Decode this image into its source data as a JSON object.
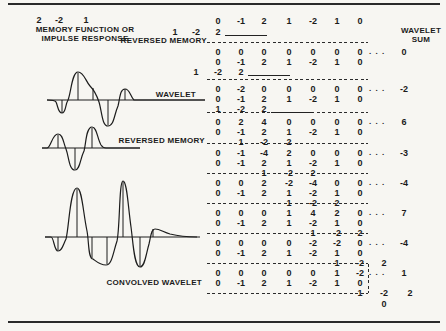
{
  "figure": {
    "memory_function": {
      "values": [
        "2",
        "-2",
        "1"
      ],
      "label_line1": "MEMORY FUNCTION OR",
      "label_line2": "IMPULSE RESPONSE"
    },
    "labels": {
      "reversed_memory_row": "REVERSED MEMORY",
      "wavelet_wave": "WAVELET",
      "reversed_memory_wave": "REVERSED MEMORY",
      "convolved_wave": "CONVOLVED WAVELET",
      "sum_header_line1": "WAVELET",
      "sum_header_line2": "SUM"
    },
    "table": {
      "wavelet": [
        "0",
        "-1",
        "2",
        "1",
        "-2",
        "1",
        "0"
      ],
      "reversed_memory": [
        "1",
        "-2",
        "2"
      ],
      "dots": ". . .",
      "header_memory_cols": [
        0,
        1,
        2
      ],
      "header_underline": true,
      "blocks": [
        {
          "products": [
            "0",
            "0",
            "0",
            "0",
            "0",
            "0",
            "0"
          ],
          "sum": "0",
          "memory_cols": [
            1,
            2,
            3
          ],
          "underline": true
        },
        {
          "products": [
            "0",
            "-2",
            "0",
            "0",
            "0",
            "0",
            "0"
          ],
          "sum": "-2",
          "memory_cols": [
            2,
            3,
            4
          ],
          "underline": true
        },
        {
          "products": [
            "0",
            "2",
            "4",
            "0",
            "0",
            "0",
            "0"
          ],
          "sum": "6",
          "memory_cols": [
            3,
            4,
            5
          ],
          "underline": false
        },
        {
          "products": [
            "0",
            "-1",
            "-4",
            "2",
            "0",
            "0",
            "0"
          ],
          "sum": "-3",
          "memory_cols": [
            4,
            5,
            6
          ],
          "underline": false
        },
        {
          "products": [
            "0",
            "0",
            "2",
            "-2",
            "-4",
            "0",
            "0"
          ],
          "sum": "-4",
          "memory_cols": [
            5,
            6,
            7
          ],
          "underline": false
        },
        {
          "products": [
            "0",
            "0",
            "0",
            "1",
            "4",
            "2",
            "0"
          ],
          "sum": "7",
          "memory_cols": [
            6,
            7,
            8
          ],
          "underline": false
        },
        {
          "products": [
            "0",
            "0",
            "0",
            "0",
            "-2",
            "-2",
            "0"
          ],
          "sum": "-4",
          "memory_cols": [
            7,
            8,
            9
          ],
          "underline": false
        },
        {
          "products": [
            "0",
            "0",
            "0",
            "0",
            "0",
            "1",
            "-2"
          ],
          "sum": "1",
          "memory_cols": [
            8,
            9,
            10
          ],
          "underline": false
        }
      ],
      "final_sum": "0"
    }
  },
  "chart_data": [
    {
      "type": "line",
      "title": "MEMORY FUNCTION OR IMPULSE RESPONSE",
      "values": [
        2,
        -2,
        1
      ]
    },
    {
      "type": "line",
      "title": "WAVELET",
      "values": [
        0,
        -1,
        2,
        1,
        -2,
        1,
        0
      ]
    },
    {
      "type": "line",
      "title": "REVERSED MEMORY",
      "values": [
        1,
        -2,
        2
      ]
    },
    {
      "type": "line",
      "title": "CONVOLVED WAVELET",
      "values": [
        0,
        -2,
        6,
        -3,
        -4,
        7,
        -4,
        1,
        0
      ]
    }
  ]
}
